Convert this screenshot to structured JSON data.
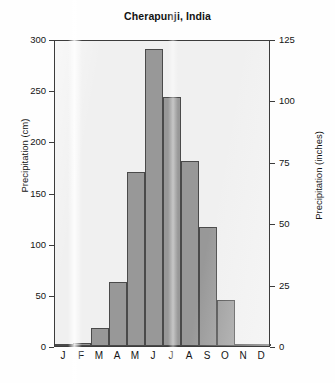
{
  "chart_data": {
    "type": "bar",
    "title": "Cherapunji, India",
    "xlabel": "",
    "ylabel": "Precipitation (cm)",
    "ylabel_secondary": "Precipitation (inches)",
    "categories": [
      "J",
      "F",
      "M",
      "A",
      "M",
      "J",
      "J",
      "A",
      "S",
      "O",
      "N",
      "D"
    ],
    "category_names": [
      "January",
      "February",
      "March",
      "April",
      "May",
      "June",
      "July",
      "August",
      "September",
      "October",
      "November",
      "December"
    ],
    "values": [
      2,
      3,
      18,
      63,
      170,
      290,
      243,
      181,
      116,
      45,
      2,
      1
    ],
    "units": "cm",
    "ylim": [
      0,
      300
    ],
    "yticks": [
      0,
      50,
      100,
      150,
      200,
      250,
      300
    ],
    "ylim_secondary": [
      0,
      125
    ],
    "yticks_secondary": [
      0,
      25,
      50,
      75,
      100,
      125
    ],
    "values_secondary": [
      0.8,
      1.2,
      7,
      25,
      67,
      114,
      96,
      71,
      46,
      18,
      0.8,
      0.4
    ],
    "grid": false,
    "legend": false,
    "bar_color": "#989898",
    "bar_edge_color": "#4a4a4a",
    "plot_background": "#f0f0f0",
    "axis_color": "#3c3c3c"
  }
}
